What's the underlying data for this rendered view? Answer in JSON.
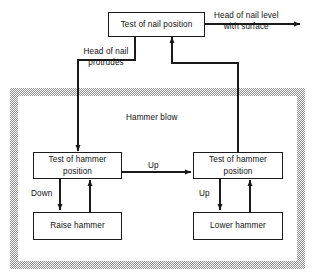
{
  "diagram": {
    "region": {
      "label": "Hammer blow",
      "style": "hatched-border"
    },
    "nodes": [
      {
        "id": "test-nail-position",
        "label": "Test of nail position"
      },
      {
        "id": "test-hammer-position-left",
        "label": "Test of hammer position"
      },
      {
        "id": "test-hammer-position-right",
        "label": "Test of hammer position"
      },
      {
        "id": "raise-hammer",
        "label": "Raise hammer"
      },
      {
        "id": "lower-hammer",
        "label": "Lower hammer"
      }
    ],
    "edge_labels": [
      {
        "id": "head-level",
        "text_line1": "Head of nail level",
        "text_line2": "with surface"
      },
      {
        "id": "head-protrudes",
        "text_line1": "Head of nail",
        "text_line2": "protrudes"
      },
      {
        "id": "up-between",
        "text": "Up"
      },
      {
        "id": "down-left",
        "text": "Down"
      },
      {
        "id": "up-right",
        "text": "Up"
      }
    ],
    "colors": {
      "line": "#1a1a1a",
      "text": "#111111",
      "background": "#ffffff",
      "hatch": "#8f8f8f"
    }
  }
}
